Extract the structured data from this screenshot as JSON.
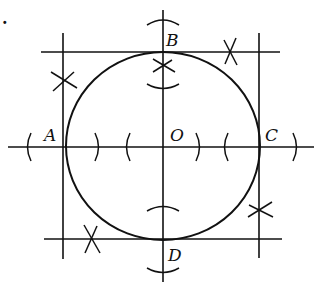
{
  "figure": {
    "number_fragment": ".",
    "labels": {
      "A": "A",
      "B": "B",
      "C": "C",
      "D": "D",
      "O": "O"
    },
    "stroke_color": "#111111",
    "background": "#ffffff",
    "circle": {
      "cx": 163,
      "cy": 147,
      "rx": 98,
      "ry": 94
    },
    "square": {
      "left": 63,
      "right": 259,
      "top": 52,
      "bottom": 239
    },
    "axes": {
      "horizontal": {
        "y": 147,
        "x1": 8,
        "x2": 314
      },
      "vertical": {
        "x": 163,
        "y1": 10,
        "y2": 282
      }
    },
    "intersection_marks": [
      {
        "name": "left-top",
        "x": 63,
        "y": 81
      },
      {
        "name": "top-right",
        "x": 231,
        "y": 52
      },
      {
        "name": "center-top",
        "x": 163,
        "y": 66
      },
      {
        "name": "right-bottom",
        "x": 260,
        "y": 210
      },
      {
        "name": "bottom-left",
        "x": 90,
        "y": 239
      }
    ]
  }
}
